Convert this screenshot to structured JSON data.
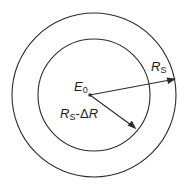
{
  "figure": {
    "type": "concentric-circles-radius-diagram",
    "background_color": "#ffffff",
    "stroke_color": "#2b2b2b",
    "text_color": "#1c1c1c",
    "width": 192,
    "height": 190,
    "center": {
      "x": 94,
      "y": 95
    },
    "circles": [
      {
        "name": "outer-circle",
        "radius": 82,
        "label_ref": "outer_radius_label"
      },
      {
        "name": "inner-circle",
        "radius": 56,
        "label_ref": "inner_radius_label"
      }
    ],
    "center_point": {
      "name": "origin-point",
      "x": 90,
      "y": 95
    }
  },
  "labels": {
    "center_label": {
      "variable": "E",
      "subscript": "0",
      "plain": "E0"
    },
    "outer_radius_label": {
      "variable": "R",
      "subscript": "S",
      "plain": "RS"
    },
    "inner_radius_label": {
      "variable_1": "R",
      "subscript_1": "S",
      "operator": "-",
      "delta": "Δ",
      "variable_2": "R",
      "plain": "RS-ΔR"
    }
  },
  "arrows": [
    {
      "name": "outer-radius-arrow",
      "from": {
        "x": 90,
        "y": 95
      },
      "to": {
        "x": 175,
        "y": 79
      },
      "points_to": "outer-circle"
    },
    {
      "name": "inner-radius-arrow",
      "from": {
        "x": 90,
        "y": 95
      },
      "to": {
        "x": 136,
        "y": 129
      },
      "points_to": "inner-circle"
    }
  ]
}
